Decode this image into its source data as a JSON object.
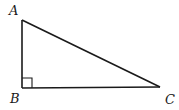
{
  "diagram": {
    "type": "right-triangle",
    "vertices": [
      {
        "label": "A",
        "x": 22,
        "y": 20
      },
      {
        "label": "B",
        "x": 22,
        "y": 88
      },
      {
        "label": "C",
        "x": 160,
        "y": 87
      }
    ],
    "right_angle_at": "B",
    "edges": [
      [
        "A",
        "B"
      ],
      [
        "B",
        "C"
      ],
      [
        "C",
        "A"
      ]
    ],
    "stroke_color": "#1a1a1a",
    "background": "#ffffff"
  },
  "labels": {
    "a": "A",
    "b": "B",
    "c": "C"
  }
}
